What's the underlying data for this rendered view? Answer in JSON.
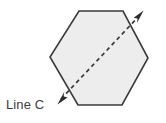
{
  "figure": {
    "background_color": "#ffffff",
    "width": 166,
    "height": 123
  },
  "shape": {
    "name": "hexagon",
    "sides": 6,
    "orientation": "flat-top",
    "fill_color": "#ededed",
    "stroke_color": "#3a3a3a",
    "stroke_width": 1.6,
    "points": "79,11 123,11 148,58 122,105 78,105 50,57"
  },
  "line": {
    "label": "Line C",
    "style": "dashed",
    "stroke_color": "#3a3a3a",
    "stroke_width": 1.7,
    "dash_pattern": "4 3.4",
    "arrowheads": "both",
    "start_x": 61,
    "start_y": 99,
    "end_x": 141,
    "end_y": 14
  },
  "label": {
    "text": "Line C",
    "color": "#3d3d3d",
    "font_size": 13,
    "x": 6,
    "y": 109
  }
}
